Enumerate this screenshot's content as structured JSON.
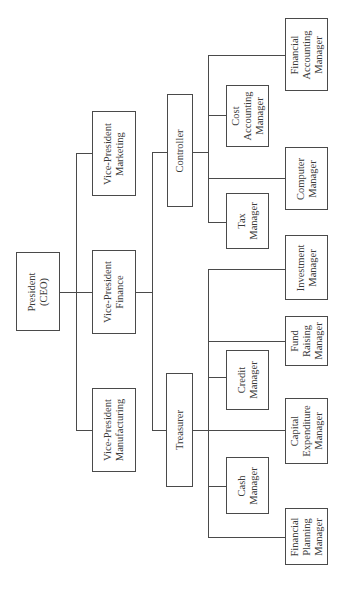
{
  "chart": {
    "type": "organization-chart",
    "orientation": "rotated-90-ccw",
    "root": {
      "label": "President\n(CEO)",
      "children": [
        {
          "label": "Vice-President\nMarketing"
        },
        {
          "label": "Vice-President\nFinance",
          "children": [
            {
              "label": "Controller",
              "children": [
                {
                  "label": "Financial\nAccounting\nManager"
                },
                {
                  "label": "Cost\nAccounting\nManager"
                },
                {
                  "label": "Computer\nManager"
                },
                {
                  "label": "Tax\nManager"
                }
              ]
            },
            {
              "label": "Treasurer",
              "children": [
                {
                  "label": "Investment\nManager"
                },
                {
                  "label": "Fund\nRaising\nManager"
                },
                {
                  "label": "Credit\nManager"
                },
                {
                  "label": "Capital\nExpenditure\nManager"
                },
                {
                  "label": "Cash\nManager"
                },
                {
                  "label": "Financial\nPlanning\nManager"
                }
              ]
            }
          ]
        },
        {
          "label": "Vice-President\nManufacturing"
        }
      ]
    }
  },
  "boxes": {
    "president": "President\n(CEO)",
    "vp_marketing": "Vice-President\nMarketing",
    "vp_finance": "Vice-President\nFinance",
    "vp_manufacturing": "Vice-President\nManufacturing",
    "controller": "Controller",
    "treasurer": "Treasurer",
    "financial_accounting_manager": "Financial\nAccounting\nManager",
    "cost_accounting_manager": "Cost\nAccounting\nManager",
    "computer_manager": "Computer\nManager",
    "tax_manager": "Tax\nManager",
    "investment_manager": "Investment\nManager",
    "fund_raising_manager": "Fund\nRaising\nManager",
    "credit_manager": "Credit\nManager",
    "capital_expenditure_manager": "Capital\nExpenditure\nManager",
    "cash_manager": "Cash\nManager",
    "financial_planning_manager": "Financial\nPlanning\nManager"
  },
  "colors": {
    "line": "#4a4a4a",
    "text": "#3a3a3a",
    "background": "#ffffff"
  }
}
